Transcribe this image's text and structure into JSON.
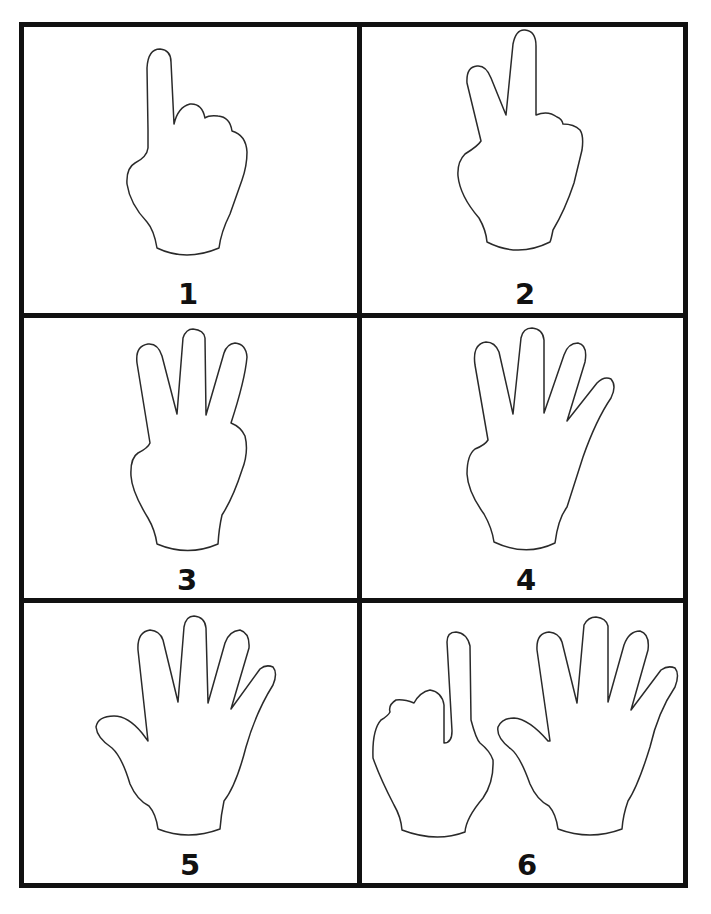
{
  "worksheet": {
    "type": "finger-counting cards",
    "grid": {
      "rows": 3,
      "columns": 2,
      "border_color": "#111111"
    },
    "cards": [
      {
        "number": "1",
        "hand": "one-finger-raised",
        "fingers_shown": 1
      },
      {
        "number": "2",
        "hand": "two-fingers-raised",
        "fingers_shown": 2
      },
      {
        "number": "3",
        "hand": "three-fingers-raised",
        "fingers_shown": 3
      },
      {
        "number": "4",
        "hand": "four-fingers-raised",
        "fingers_shown": 4
      },
      {
        "number": "5",
        "hand": "open-hand-five-fingers",
        "fingers_shown": 5
      },
      {
        "number": "6",
        "hand": "one-finger-plus-open-hand",
        "fingers_shown": 6
      }
    ]
  }
}
